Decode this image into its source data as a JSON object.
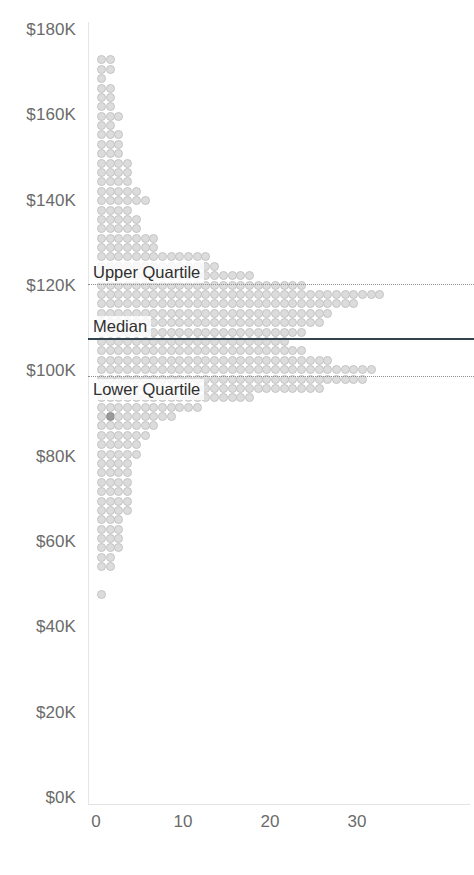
{
  "chart_data": {
    "type": "bar",
    "orientation": "horizontal-dotplot",
    "title": "",
    "subtitle": "",
    "xlabel": "",
    "ylabel": "",
    "xlim": [
      0,
      34
    ],
    "ylim": [
      0,
      180000
    ],
    "grid": false,
    "legend": null,
    "x_ticks": [
      "0",
      "10",
      "20",
      "30"
    ],
    "x_tick_values": [
      0,
      10,
      20,
      30
    ],
    "y_ticks": [
      "$0K",
      "$20K",
      "$40K",
      "$60K",
      "$80K",
      "$100K",
      "$120K",
      "$140K",
      "$160K",
      "$180K"
    ],
    "y_tick_values": [
      0,
      20000,
      40000,
      60000,
      80000,
      100000,
      120000,
      140000,
      160000,
      180000
    ],
    "bin_size": 2200,
    "categories": [
      173000,
      170800,
      168600,
      166400,
      164200,
      162000,
      159800,
      157600,
      155400,
      153200,
      151000,
      148800,
      146600,
      144400,
      142200,
      140000,
      137800,
      135600,
      133400,
      131200,
      129000,
      126800,
      124600,
      122400,
      120200,
      118000,
      115800,
      113600,
      111400,
      109200,
      107000,
      104800,
      102600,
      100400,
      98200,
      96000,
      93800,
      91600,
      89400,
      87200,
      85000,
      82800,
      80600,
      78400,
      76200,
      74000,
      71800,
      69600,
      67400,
      65200,
      63000,
      60800,
      58600,
      56400,
      54200,
      52000,
      49800,
      47600
    ],
    "values": [
      2,
      2,
      1,
      2,
      2,
      2,
      3,
      2,
      3,
      3,
      3,
      4,
      4,
      4,
      5,
      6,
      4,
      5,
      5,
      7,
      7,
      13,
      14,
      18,
      24,
      33,
      30,
      27,
      26,
      24,
      22,
      24,
      27,
      32,
      31,
      26,
      18,
      12,
      9,
      7,
      6,
      5,
      5,
      4,
      4,
      4,
      4,
      4,
      4,
      3,
      3,
      3,
      3,
      2,
      2,
      0,
      0,
      1
    ],
    "highlighted_point": {
      "x": 1,
      "y": 89400,
      "color": "#9a9a9a"
    },
    "dot_color": "#dcdcdc",
    "dot_border_color": "#c4c4c4",
    "reference_lines": [
      {
        "id": "upper-quartile",
        "label": "Upper Quartile",
        "value": 120500,
        "style": "dotted",
        "color": "#8f8f8f",
        "label_position": "above-left"
      },
      {
        "id": "median",
        "label": "Median",
        "value": 107800,
        "style": "solid",
        "color": "#33424f",
        "label_position": "above-left"
      },
      {
        "id": "lower-quartile",
        "label": "Lower Quartile",
        "value": 98800,
        "style": "dotted",
        "color": "#8f8f8f",
        "label_position": "below-left"
      }
    ]
  },
  "axis": {
    "y_labels": [
      "$180K",
      "$160K",
      "$140K",
      "$120K",
      "$100K",
      "$80K",
      "$60K",
      "$40K",
      "$20K",
      "$0K"
    ],
    "x_labels": [
      "0",
      "10",
      "20",
      "30"
    ]
  },
  "labels": {
    "upper_quartile": "Upper Quartile",
    "median": "Median",
    "lower_quartile": "Lower Quartile"
  }
}
